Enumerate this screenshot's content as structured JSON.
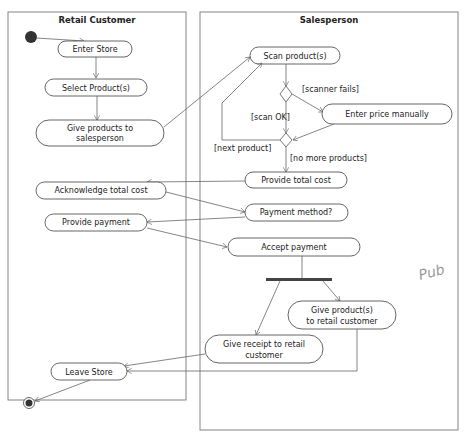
{
  "lanes": {
    "customer": {
      "title": "Retail Customer"
    },
    "salesperson": {
      "title": "Salesperson"
    }
  },
  "activities": {
    "enter_store": "Enter Store",
    "select_products": "Select Product(s)",
    "give_products_1": "Give products to",
    "give_products_2": "salesperson",
    "scan_products": "Scan product(s)",
    "enter_price": "Enter price manually",
    "provide_total": "Provide total cost",
    "ack_total": "Acknowledge total cost",
    "payment_method": "Payment method?",
    "provide_payment": "Provide payment",
    "accept_payment": "Accept payment",
    "give_product_cust_1": "Give product(s)",
    "give_product_cust_2": "to retail customer",
    "give_receipt_1": "Give receipt to retail",
    "give_receipt_2": "customer",
    "leave_store": "Leave Store"
  },
  "guards": {
    "scanner_fails": "[scanner fails]",
    "scan_ok": "[scan OK]",
    "next_product": "[next product]",
    "no_more_products": "[no more products]"
  },
  "annotation": {
    "handwriting": "Pub"
  }
}
